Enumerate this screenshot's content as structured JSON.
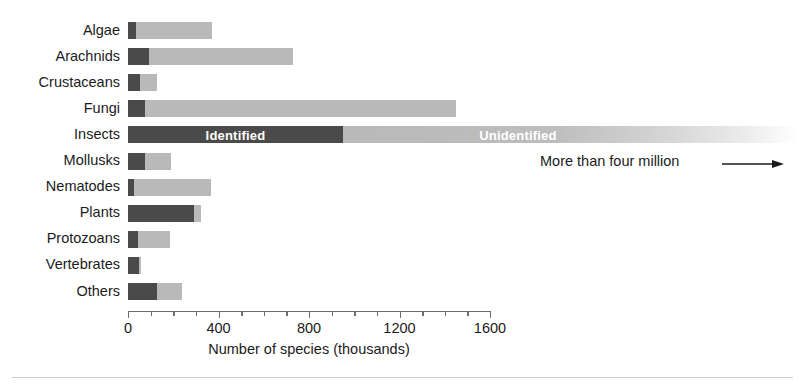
{
  "chart_data": {
    "type": "bar",
    "orientation": "horizontal",
    "stacked": true,
    "title": "",
    "xlabel": "Number of species (thousands)",
    "ylabel": "",
    "xlim": [
      0,
      1600
    ],
    "xticks": [
      0,
      400,
      800,
      1200,
      1600
    ],
    "xtick_labels": [
      "0",
      "400",
      "800",
      "1200",
      "1600"
    ],
    "minor_tick_interval": 100,
    "grid": false,
    "legend_position": "in-bar",
    "categories": [
      "Algae",
      "Arachnids",
      "Crustaceans",
      "Fungi",
      "Insects",
      "Mollusks",
      "Nematodes",
      "Plants",
      "Protozoans",
      "Vertebrates",
      "Others"
    ],
    "series": [
      {
        "name": "Identified",
        "color": "#4a4a4a",
        "values": [
          35,
          95,
          55,
          75,
          950,
          75,
          27,
          293,
          45,
          50,
          130
        ]
      },
      {
        "name": "Unidentified",
        "color": "#b9b9b9",
        "values": [
          335,
          635,
          75,
          1375,
          3050,
          115,
          341,
          31,
          141,
          8,
          110
        ]
      }
    ],
    "totals": [
      370,
      730,
      130,
      1450,
      4000,
      190,
      368,
      324,
      186,
      58,
      240
    ],
    "bar_labels": [
      {
        "category": "Insects",
        "series": "Identified",
        "text": "Identified"
      },
      {
        "category": "Insects",
        "series": "Unidentified",
        "text": "Unidentified"
      }
    ],
    "annotations": [
      {
        "text": "More than four million",
        "icon": "right-arrow",
        "target": "Insects"
      }
    ]
  },
  "axis": {
    "xlabel": "Number of species (thousands)",
    "ticks": [
      {
        "value": 0,
        "label": "0",
        "major": true
      },
      {
        "value": 100,
        "label": "",
        "major": false
      },
      {
        "value": 200,
        "label": "",
        "major": false
      },
      {
        "value": 300,
        "label": "",
        "major": false
      },
      {
        "value": 400,
        "label": "400",
        "major": true
      },
      {
        "value": 500,
        "label": "",
        "major": false
      },
      {
        "value": 600,
        "label": "",
        "major": false
      },
      {
        "value": 700,
        "label": "",
        "major": false
      },
      {
        "value": 800,
        "label": "800",
        "major": true
      },
      {
        "value": 900,
        "label": "",
        "major": false
      },
      {
        "value": 1000,
        "label": "",
        "major": false
      },
      {
        "value": 1100,
        "label": "",
        "major": false
      },
      {
        "value": 1200,
        "label": "1200",
        "major": true
      },
      {
        "value": 1300,
        "label": "",
        "major": false
      },
      {
        "value": 1400,
        "label": "",
        "major": false
      },
      {
        "value": 1500,
        "label": "",
        "major": false
      },
      {
        "value": 1600,
        "label": "1600",
        "major": true
      }
    ]
  },
  "colors": {
    "identified": "#4a4a4a",
    "unidentified": "#b9b9b9",
    "text": "#1b1b1b",
    "axis": "#6d6d6d",
    "rule": "#cfcfcf",
    "background": "#ffffff"
  },
  "labels": {
    "identified": "Identified",
    "unidentified": "Unidentified",
    "annotation": "More than four million"
  }
}
